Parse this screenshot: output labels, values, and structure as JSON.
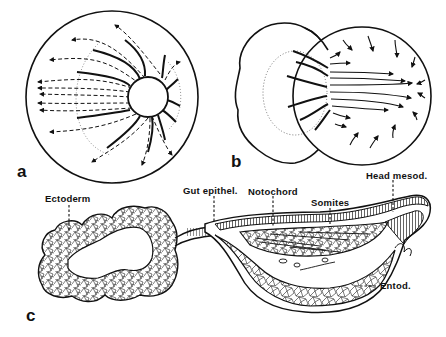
{
  "figure": {
    "panels": [
      {
        "id": "a",
        "label": "a",
        "description": "Sphere with central yolk plug; dashed arrows radiating leftward (movement paths), solid curved lines converging on small circle"
      },
      {
        "id": "b",
        "label": "b",
        "description": "Irregular lobed mass fused to a sphere; solid lines crossing boundary with arrows pointing right; peripheral arrows converging inward"
      },
      {
        "id": "c",
        "label": "c",
        "description": "Sectioned embryo: lobed ectoderm ring connected by stalk to elongated embryo body containing notochord, somites, head mesoderm, and entoderm"
      }
    ],
    "annotations": {
      "ectoderm": "Ectoderm",
      "gut_epithel": "Gut epithel.",
      "notochord": "Notochord",
      "somites": "Somites",
      "head_mesod": "Head mesod.",
      "entod": "Entod."
    },
    "colors": {
      "ink": "#111111",
      "background": "#ffffff"
    }
  }
}
